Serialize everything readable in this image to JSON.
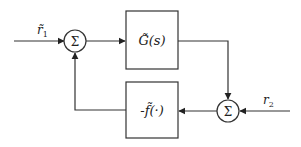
{
  "diagram": {
    "type": "block-diagram",
    "inputs": {
      "r1": {
        "label": "r̃",
        "subscript": "1"
      },
      "r2": {
        "label": "r",
        "subscript": "2"
      }
    },
    "blocks": {
      "plant": {
        "label": "G̃(s)"
      },
      "feedback": {
        "label": "-f̃(·)"
      }
    },
    "junctions": {
      "sum1": {
        "symbol": "Σ"
      },
      "sum2": {
        "symbol": "Σ"
      }
    },
    "colors": {
      "stroke": "#333333",
      "background": "#ffffff"
    }
  }
}
